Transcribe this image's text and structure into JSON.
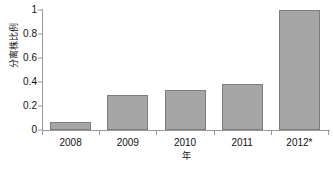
{
  "chart_data": {
    "type": "bar",
    "title": "",
    "subtitle": "",
    "xlabel": "年",
    "ylabel": "分离株比例",
    "categories": [
      "2008",
      "2009",
      "2010",
      "2011",
      "2012*"
    ],
    "values": [
      0.07,
      0.29,
      0.33,
      0.38,
      1.0
    ],
    "series": [
      {
        "name": "分离株比例",
        "values": [
          0.07,
          0.29,
          0.33,
          0.38,
          1.0
        ]
      }
    ],
    "ylim": [
      0,
      1
    ],
    "xlim_categories": 5,
    "y_ticks": [
      0,
      0.2,
      0.4,
      0.6,
      0.8,
      1
    ],
    "y_tick_labels": [
      "0",
      "0.2",
      "0.4",
      "0.6",
      "0.8",
      "1"
    ],
    "grid": false,
    "legend": false,
    "legend_position": "none",
    "annotations": [
      "*"
    ],
    "bar_fill_color": "#a6a6a6",
    "bar_border_color": "#7d7d7d",
    "axis_color": "#9a9a9a",
    "background_color": "#ffffff",
    "text_color": "#111111"
  }
}
